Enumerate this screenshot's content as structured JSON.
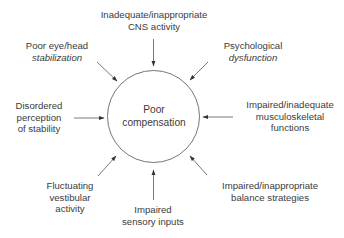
{
  "diagram": {
    "center": {
      "lines": [
        "Poor",
        "compensation"
      ]
    },
    "factors": [
      {
        "id": "cns",
        "lines": [
          "Inadequate/inappropriate",
          "CNS activity"
        ],
        "italic": [
          false,
          false
        ]
      },
      {
        "id": "psych",
        "lines": [
          "Psychological",
          "dysfunction"
        ],
        "italic": [
          false,
          true
        ]
      },
      {
        "id": "musculo",
        "lines": [
          "Impaired/inadequate",
          "musculoskeletal",
          "functions"
        ],
        "italic": [
          false,
          false,
          false
        ]
      },
      {
        "id": "balance",
        "lines": [
          "Impaired/inappropriate",
          "balance strategies"
        ],
        "italic": [
          false,
          false
        ]
      },
      {
        "id": "sensory",
        "lines": [
          "Impaired",
          "sensory inputs"
        ],
        "italic": [
          false,
          false
        ]
      },
      {
        "id": "vestibular",
        "lines": [
          "Fluctuating",
          "vestibular",
          "activity"
        ],
        "italic": [
          false,
          false,
          false
        ]
      },
      {
        "id": "perception",
        "lines": [
          "Disordered",
          "perception",
          "of stability"
        ],
        "italic": [
          false,
          false,
          false
        ]
      },
      {
        "id": "eyehead",
        "lines": [
          "Poor eye/head",
          "stabilization"
        ],
        "italic": [
          false,
          true
        ]
      }
    ],
    "colors": {
      "line": "#555555",
      "text": "#3b3b3b",
      "background": "#ffffff"
    }
  }
}
